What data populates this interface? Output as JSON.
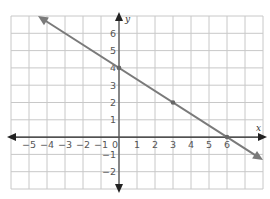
{
  "chart_data": {
    "type": "line",
    "title": "",
    "xlabel": "x",
    "ylabel": "y",
    "xlim": [
      -6,
      8
    ],
    "ylim": [
      -3,
      7
    ],
    "grid": true,
    "x_ticks": [
      "−5",
      "−4",
      "−3",
      "−2",
      "−1",
      "0",
      "1",
      "2",
      "3",
      "4",
      "5",
      "6"
    ],
    "y_ticks": [
      "6",
      "5",
      "4",
      "3",
      "2",
      "1",
      "−1",
      "−2"
    ],
    "series": [
      {
        "name": "line",
        "equation": "y = -2/3 x + 4",
        "x": [
          -4.5,
          8
        ],
        "y": [
          7,
          -1.33
        ],
        "marked_points": [
          [
            0,
            4
          ],
          [
            3,
            2
          ],
          [
            6,
            0
          ]
        ],
        "arrows_both_ends": true
      }
    ],
    "colors": {
      "line": "#7a7a7a",
      "grid": "#c8c8c8",
      "axis": "#222222",
      "point": "#666666"
    }
  }
}
